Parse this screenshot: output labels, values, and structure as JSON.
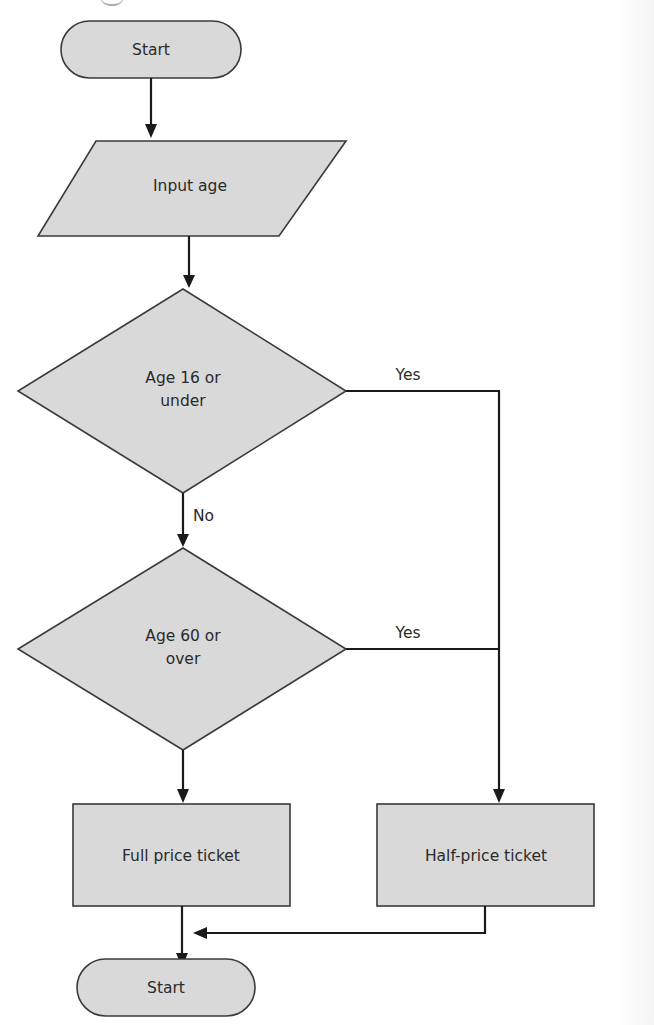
{
  "diagram": {
    "type": "flowchart",
    "colors": {
      "shape_fill": "#d9d9d9",
      "shape_stroke": "#3a3a3a",
      "line": "#1a1a1a",
      "text": "#2a2a2a",
      "background": "#ffffff"
    },
    "nodes": [
      {
        "id": "start",
        "shape": "terminator",
        "label": "Start"
      },
      {
        "id": "input",
        "shape": "parallelogram",
        "label": "Input age"
      },
      {
        "id": "decision1",
        "shape": "diamond",
        "label_line1": "Age 16 or",
        "label_line2": "under"
      },
      {
        "id": "decision2",
        "shape": "diamond",
        "label_line1": "Age 60 or",
        "label_line2": "over"
      },
      {
        "id": "full",
        "shape": "rectangle",
        "label": "Full price ticket"
      },
      {
        "id": "half",
        "shape": "rectangle",
        "label": "Half-price ticket"
      },
      {
        "id": "end",
        "shape": "terminator",
        "label": "Start"
      }
    ],
    "edges": [
      {
        "from": "start",
        "to": "input",
        "label": ""
      },
      {
        "from": "input",
        "to": "decision1",
        "label": ""
      },
      {
        "from": "decision1",
        "to": "half",
        "label": "Yes"
      },
      {
        "from": "decision1",
        "to": "decision2",
        "label": "No"
      },
      {
        "from": "decision2",
        "to": "half",
        "label": "Yes"
      },
      {
        "from": "decision2",
        "to": "full",
        "label": ""
      },
      {
        "from": "full",
        "to": "end",
        "label": ""
      },
      {
        "from": "half",
        "to": "end",
        "label": ""
      }
    ],
    "edge_labels": {
      "d1_yes": "Yes",
      "d1_no": "No",
      "d2_yes": "Yes"
    }
  }
}
